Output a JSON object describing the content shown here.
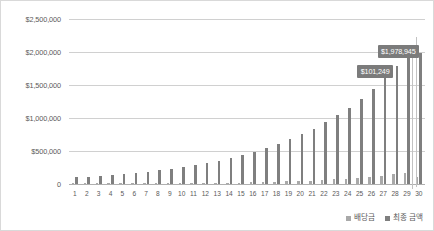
{
  "chart_data": {
    "type": "bar",
    "title": "",
    "subtitle": "",
    "xlabel": "",
    "ylabel": "",
    "ylim": [
      0,
      2500000
    ],
    "grid": true,
    "legend_position": "bottom-right",
    "y_ticks": [
      "0",
      "$500,000",
      "$1,000,000",
      "$1,500,000",
      "$2,000,000",
      "$2,500,000"
    ],
    "y_tick_values": [
      0,
      500000,
      1000000,
      1500000,
      2000000,
      2500000
    ],
    "categories": [
      "1",
      "2",
      "3",
      "4",
      "5",
      "6",
      "7",
      "8",
      "9",
      "10",
      "11",
      "12",
      "13",
      "14",
      "15",
      "16",
      "17",
      "18",
      "19",
      "20",
      "21",
      "22",
      "23",
      "24",
      "25",
      "26",
      "27",
      "28",
      "29",
      "30"
    ],
    "series": [
      {
        "name": "배당금",
        "color": "#a9a9a9",
        "values": [
          3000,
          3400,
          3900,
          4500,
          5200,
          6000,
          6900,
          8000,
          9200,
          10600,
          12300,
          14200,
          16400,
          19000,
          22000,
          25400,
          29400,
          34000,
          39300,
          45500,
          52600,
          60900,
          70400,
          81400,
          94200,
          108900,
          125900,
          145600,
          168300,
          101249
        ]
      },
      {
        "name": "최종 금액",
        "color": "#7f7f7f",
        "values": [
          100000,
          111000,
          123000,
          137000,
          152000,
          169000,
          188000,
          209000,
          232000,
          258000,
          287000,
          319000,
          355000,
          395000,
          439000,
          489000,
          544000,
          606000,
          675000,
          752000,
          838000,
          933000,
          1039000,
          1158000,
          1290000,
          1438000,
          1602000,
          1785000,
          1989000,
          1978945
        ]
      }
    ],
    "annotations": [
      {
        "name": "final-amount-label",
        "text": "$1,978,945",
        "series": "최종 금액",
        "category": "30",
        "value": 1978945
      },
      {
        "name": "dividend-label",
        "text": "$101,249",
        "series": "배당금",
        "category": "30",
        "value": 101249
      }
    ]
  },
  "legend": {
    "items": [
      {
        "label": "배당금",
        "color": "#a9a9a9"
      },
      {
        "label": "최종 금액",
        "color": "#7f7f7f"
      }
    ]
  },
  "colors": {
    "dividend": "#a9a9a9",
    "final": "#7f7f7f",
    "gridline": "#d0d0d0",
    "label_background": "#7b7b7b",
    "text": "#5a5a5a",
    "border": "#d9d9d9"
  }
}
